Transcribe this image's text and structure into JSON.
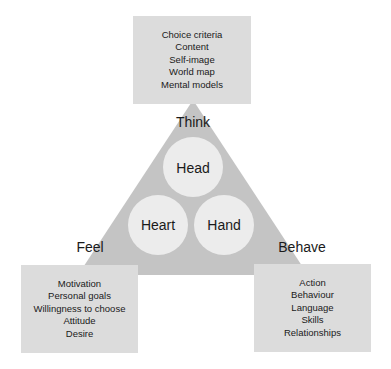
{
  "diagram": {
    "colors": {
      "triangle": "#c4c4c4",
      "box": "#dcdcdc",
      "circle": "#ececec",
      "text": "#1a1a1a"
    },
    "corners": {
      "think": {
        "label": "Think",
        "items": [
          "Choice criteria",
          "Content",
          "Self-image",
          "World map",
          "Mental models"
        ]
      },
      "feel": {
        "label": "Feel",
        "items": [
          "Motivation",
          "Personal goals",
          "Willingness to choose",
          "Attitude",
          "Desire"
        ]
      },
      "behave": {
        "label": "Behave",
        "items": [
          "Action",
          "Behaviour",
          "Language",
          "Skills",
          "Relationships"
        ]
      }
    },
    "circles": {
      "head": "Head",
      "heart": "Heart",
      "hand": "Hand"
    }
  }
}
